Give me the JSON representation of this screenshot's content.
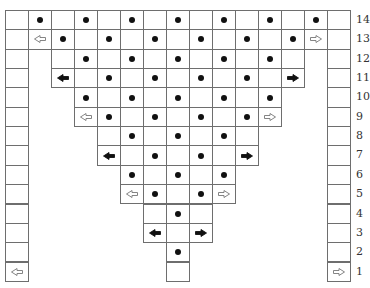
{
  "diagram": {
    "type": "triangular-grid-puzzle",
    "columns": 15,
    "row_labels": [
      "14",
      "13",
      "12",
      "11",
      "10",
      "9",
      "8",
      "7",
      "6",
      "5",
      "4",
      "3",
      "2",
      "1"
    ],
    "colors": {
      "line": "#6e6e6e",
      "dot": "#111111",
      "background": "#ffffff"
    },
    "rows": [
      {
        "label": "14",
        "cells": [
          {
            "c": 0,
            "m": ""
          },
          {
            "c": 1,
            "m": "dot"
          },
          {
            "c": 2,
            "m": ""
          },
          {
            "c": 3,
            "m": "dot"
          },
          {
            "c": 4,
            "m": ""
          },
          {
            "c": 5,
            "m": "dot"
          },
          {
            "c": 6,
            "m": ""
          },
          {
            "c": 7,
            "m": "dot"
          },
          {
            "c": 8,
            "m": ""
          },
          {
            "c": 9,
            "m": "dot"
          },
          {
            "c": 10,
            "m": ""
          },
          {
            "c": 11,
            "m": "dot"
          },
          {
            "c": 12,
            "m": ""
          },
          {
            "c": 13,
            "m": "dot"
          },
          {
            "c": 14,
            "m": ""
          }
        ]
      },
      {
        "label": "13",
        "cells": [
          {
            "c": 0,
            "m": ""
          },
          {
            "c": 1,
            "m": "left-outline"
          },
          {
            "c": 2,
            "m": "dot"
          },
          {
            "c": 3,
            "m": ""
          },
          {
            "c": 4,
            "m": "dot"
          },
          {
            "c": 5,
            "m": ""
          },
          {
            "c": 6,
            "m": "dot"
          },
          {
            "c": 7,
            "m": ""
          },
          {
            "c": 8,
            "m": "dot"
          },
          {
            "c": 9,
            "m": ""
          },
          {
            "c": 10,
            "m": "dot"
          },
          {
            "c": 11,
            "m": ""
          },
          {
            "c": 12,
            "m": "dot"
          },
          {
            "c": 13,
            "m": "right-outline"
          },
          {
            "c": 14,
            "m": ""
          }
        ]
      },
      {
        "label": "12",
        "cells": [
          {
            "c": 0,
            "m": ""
          },
          {
            "c": 2,
            "m": ""
          },
          {
            "c": 3,
            "m": "dot"
          },
          {
            "c": 4,
            "m": ""
          },
          {
            "c": 5,
            "m": "dot"
          },
          {
            "c": 6,
            "m": ""
          },
          {
            "c": 7,
            "m": "dot"
          },
          {
            "c": 8,
            "m": ""
          },
          {
            "c": 9,
            "m": "dot"
          },
          {
            "c": 10,
            "m": ""
          },
          {
            "c": 11,
            "m": "dot"
          },
          {
            "c": 12,
            "m": ""
          },
          {
            "c": 14,
            "m": ""
          }
        ]
      },
      {
        "label": "11",
        "cells": [
          {
            "c": 0,
            "m": ""
          },
          {
            "c": 2,
            "m": "left-filled"
          },
          {
            "c": 3,
            "m": ""
          },
          {
            "c": 4,
            "m": "dot"
          },
          {
            "c": 5,
            "m": ""
          },
          {
            "c": 6,
            "m": "dot"
          },
          {
            "c": 7,
            "m": ""
          },
          {
            "c": 8,
            "m": "dot"
          },
          {
            "c": 9,
            "m": ""
          },
          {
            "c": 10,
            "m": "dot"
          },
          {
            "c": 11,
            "m": ""
          },
          {
            "c": 12,
            "m": "right-filled"
          },
          {
            "c": 14,
            "m": ""
          }
        ]
      },
      {
        "label": "10",
        "cells": [
          {
            "c": 0,
            "m": ""
          },
          {
            "c": 3,
            "m": "dot"
          },
          {
            "c": 4,
            "m": ""
          },
          {
            "c": 5,
            "m": "dot"
          },
          {
            "c": 6,
            "m": ""
          },
          {
            "c": 7,
            "m": "dot"
          },
          {
            "c": 8,
            "m": ""
          },
          {
            "c": 9,
            "m": "dot"
          },
          {
            "c": 10,
            "m": ""
          },
          {
            "c": 11,
            "m": "dot"
          },
          {
            "c": 14,
            "m": ""
          }
        ]
      },
      {
        "label": "9",
        "cells": [
          {
            "c": 0,
            "m": ""
          },
          {
            "c": 3,
            "m": "left-outline"
          },
          {
            "c": 4,
            "m": "dot"
          },
          {
            "c": 5,
            "m": ""
          },
          {
            "c": 6,
            "m": "dot"
          },
          {
            "c": 7,
            "m": ""
          },
          {
            "c": 8,
            "m": "dot"
          },
          {
            "c": 9,
            "m": ""
          },
          {
            "c": 10,
            "m": "dot"
          },
          {
            "c": 11,
            "m": "right-outline"
          },
          {
            "c": 14,
            "m": ""
          }
        ]
      },
      {
        "label": "8",
        "cells": [
          {
            "c": 0,
            "m": ""
          },
          {
            "c": 4,
            "m": ""
          },
          {
            "c": 5,
            "m": "dot"
          },
          {
            "c": 6,
            "m": ""
          },
          {
            "c": 7,
            "m": "dot"
          },
          {
            "c": 8,
            "m": ""
          },
          {
            "c": 9,
            "m": "dot"
          },
          {
            "c": 10,
            "m": ""
          },
          {
            "c": 14,
            "m": ""
          }
        ]
      },
      {
        "label": "7",
        "cells": [
          {
            "c": 0,
            "m": ""
          },
          {
            "c": 4,
            "m": "left-filled"
          },
          {
            "c": 5,
            "m": ""
          },
          {
            "c": 6,
            "m": "dot"
          },
          {
            "c": 7,
            "m": ""
          },
          {
            "c": 8,
            "m": "dot"
          },
          {
            "c": 9,
            "m": ""
          },
          {
            "c": 10,
            "m": "right-filled"
          },
          {
            "c": 14,
            "m": ""
          }
        ]
      },
      {
        "label": "6",
        "cells": [
          {
            "c": 0,
            "m": ""
          },
          {
            "c": 5,
            "m": "dot"
          },
          {
            "c": 6,
            "m": ""
          },
          {
            "c": 7,
            "m": "dot"
          },
          {
            "c": 8,
            "m": ""
          },
          {
            "c": 9,
            "m": "dot"
          },
          {
            "c": 14,
            "m": ""
          }
        ]
      },
      {
        "label": "5",
        "cells": [
          {
            "c": 0,
            "m": ""
          },
          {
            "c": 5,
            "m": "left-outline"
          },
          {
            "c": 6,
            "m": "dot"
          },
          {
            "c": 7,
            "m": ""
          },
          {
            "c": 8,
            "m": "dot"
          },
          {
            "c": 9,
            "m": "right-outline"
          },
          {
            "c": 14,
            "m": ""
          }
        ]
      },
      {
        "label": "4",
        "cells": [
          {
            "c": 0,
            "m": ""
          },
          {
            "c": 6,
            "m": ""
          },
          {
            "c": 7,
            "m": "dot"
          },
          {
            "c": 8,
            "m": ""
          },
          {
            "c": 14,
            "m": ""
          }
        ]
      },
      {
        "label": "3",
        "cells": [
          {
            "c": 0,
            "m": ""
          },
          {
            "c": 6,
            "m": "left-filled"
          },
          {
            "c": 7,
            "m": ""
          },
          {
            "c": 8,
            "m": "right-filled"
          },
          {
            "c": 14,
            "m": ""
          }
        ]
      },
      {
        "label": "2",
        "cells": [
          {
            "c": 0,
            "m": ""
          },
          {
            "c": 7,
            "m": "dot"
          },
          {
            "c": 14,
            "m": ""
          }
        ]
      },
      {
        "label": "1",
        "cells": [
          {
            "c": 0,
            "m": "left-outline"
          },
          {
            "c": 7,
            "m": ""
          },
          {
            "c": 14,
            "m": "right-outline"
          }
        ]
      }
    ]
  }
}
